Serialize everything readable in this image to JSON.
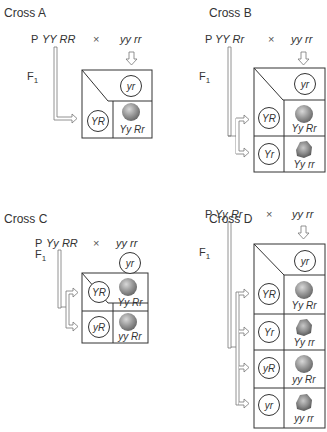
{
  "crosses": [
    {
      "title": "Cross A",
      "p_label": "P",
      "parent1": "YY RR",
      "times": "×",
      "parent2": "yy rr",
      "f1_label": "F",
      "f1_sub": "1",
      "column_gamete": "yr",
      "rows": [
        {
          "gamete": "YR",
          "offspring": "Yy Rr",
          "phenotype": "round"
        }
      ]
    },
    {
      "title": "Cross B",
      "p_label": "P",
      "parent1": "YY Rr",
      "times": "×",
      "parent2": "yy rr",
      "f1_label": "F",
      "f1_sub": "1",
      "column_gamete": "yr",
      "rows": [
        {
          "gamete": "YR",
          "offspring": "Yy Rr",
          "phenotype": "round"
        },
        {
          "gamete": "Yr",
          "offspring": "Yy rr",
          "phenotype": "wrinkled"
        }
      ]
    },
    {
      "title": "Cross C",
      "p_label": "P",
      "parent1": "Yy RR",
      "times": "×",
      "parent2": "yy rr",
      "f1_label": "F",
      "f1_sub": "1",
      "column_gamete": "yr",
      "rows": [
        {
          "gamete": "YR",
          "offspring": "Yy Rr",
          "phenotype": "round"
        },
        {
          "gamete": "yR",
          "offspring": "yy Rr",
          "phenotype": "round"
        }
      ]
    },
    {
      "title": "Cross D",
      "p_label": "P",
      "parent1": "Yy Rr",
      "times": "×",
      "parent2": "yy rr",
      "f1_label": "F",
      "f1_sub": "1",
      "column_gamete": "yr",
      "rows": [
        {
          "gamete": "YR",
          "offspring": "Yy Rr",
          "phenotype": "round"
        },
        {
          "gamete": "Yr",
          "offspring": "Yy rr",
          "phenotype": "wrinkled"
        },
        {
          "gamete": "yR",
          "offspring": "yy Rr",
          "phenotype": "round"
        },
        {
          "gamete": "yr",
          "offspring": "yy rr",
          "phenotype": "wrinkled"
        }
      ]
    }
  ],
  "colors": {
    "line": "#333333",
    "arrow": "#666666",
    "pea": "#8a8a8a"
  }
}
